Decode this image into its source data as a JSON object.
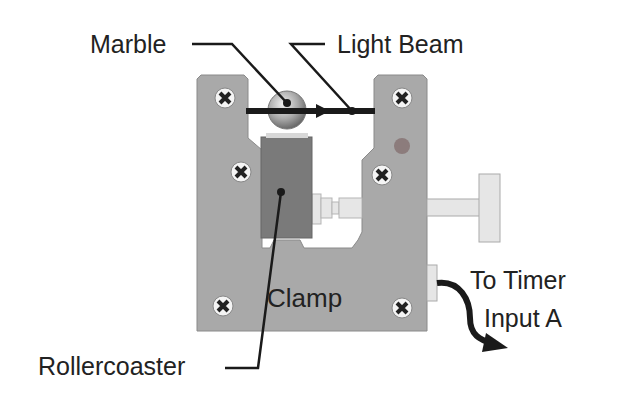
{
  "diagram": {
    "labels": {
      "marble": "Marble",
      "light_beam": "Light Beam",
      "clamp": "Clamp",
      "rollercoaster": "Rollercoaster",
      "timer_line1": "To Timer",
      "timer_line2": "Input A"
    },
    "colors": {
      "clamp_body": "#a9a9a9",
      "block": "#7a7a7a",
      "beam": "#1a1a1a",
      "sensor_dot": "#8c7c7c",
      "knob": "#e6e6e6"
    }
  }
}
